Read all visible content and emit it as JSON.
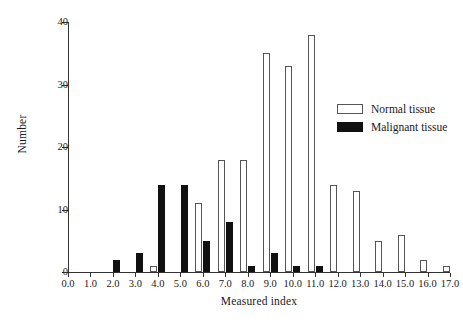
{
  "chart_data": {
    "type": "bar",
    "title": "",
    "xlabel": "Measured index",
    "ylabel": "Number",
    "categories": [
      "0.0",
      "1.0",
      "2.0",
      "3.0",
      "4.0",
      "5.0",
      "6.0",
      "7.0",
      "8.0",
      "9.0",
      "10.0",
      "11.0",
      "12.0",
      "13.0",
      "14.0",
      "15.0",
      "16.0",
      "17.0"
    ],
    "series": [
      {
        "name": "Normal tissue",
        "color": "#ffffff",
        "edge_color": "#555555",
        "values": [
          0,
          0,
          0,
          0,
          1,
          0,
          11,
          18,
          18,
          35,
          33,
          38,
          14,
          13,
          5,
          6,
          2,
          1
        ]
      },
      {
        "name": "Malignant tissue",
        "color": "#111111",
        "edge_color": "#111111",
        "values": [
          0,
          0,
          2,
          3,
          14,
          14,
          5,
          8,
          1,
          3,
          1,
          1,
          0,
          0,
          0,
          0,
          0,
          0
        ]
      }
    ],
    "xlim": [
      0.0,
      17.0
    ],
    "ylim": [
      0,
      40
    ],
    "ytick_labels": [
      "0",
      "10",
      "20",
      "30",
      "40"
    ],
    "ytick_values": [
      0,
      10,
      20,
      30,
      40
    ],
    "grid": false,
    "legend_position": "upper right",
    "legend_entries": [
      "Normal tissue",
      "Malignant tissue"
    ]
  }
}
